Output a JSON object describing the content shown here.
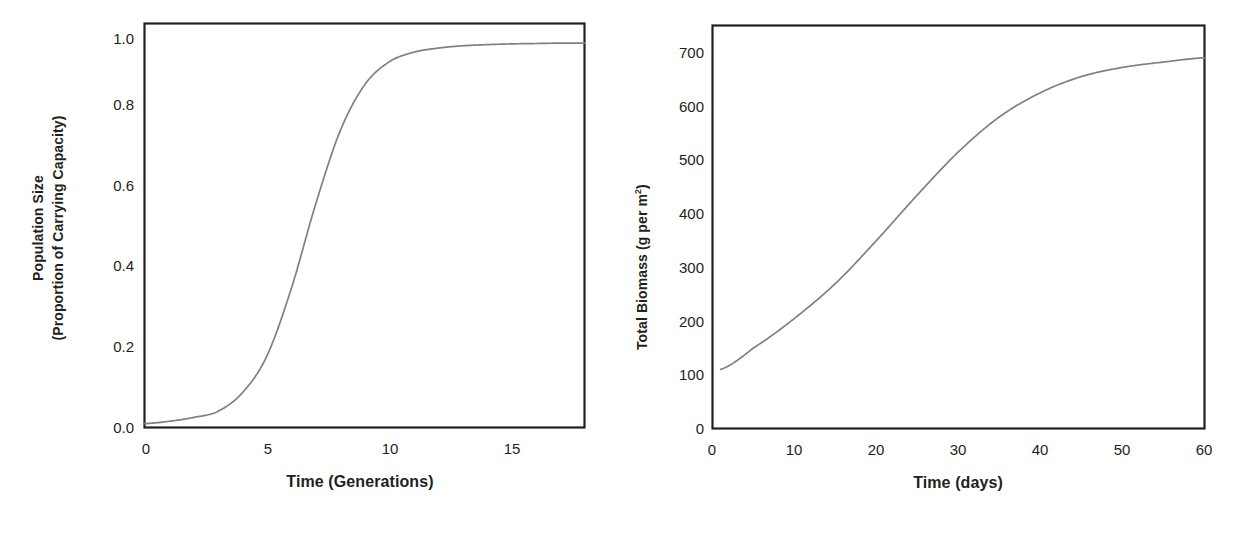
{
  "figure": {
    "background": "#ffffff",
    "line_color": "#808080",
    "frame_color": "#231f20",
    "text_color": "#231f20"
  },
  "chart_data": [
    {
      "id": "logistic-population-growth",
      "type": "line",
      "title": "",
      "xlabel": "Time (Generations)",
      "ylabel_line1": "Population Size",
      "ylabel_line2": "(Proportion of Carrying Capacity)",
      "xlim": [
        0,
        18
      ],
      "ylim": [
        0,
        1.05
      ],
      "xticks": [
        "0",
        "5",
        "10",
        "15"
      ],
      "xtick_values": [
        0,
        5,
        10,
        15
      ],
      "yticks": [
        "0.0",
        "0.2",
        "0.4",
        "0.6",
        "0.8",
        "1.0"
      ],
      "ytick_values": [
        0.0,
        0.2,
        0.4,
        0.6,
        0.8,
        1.0
      ],
      "grid": false,
      "legend": "none",
      "series": [
        {
          "name": "Population size (proportion of K)",
          "color": "#808080",
          "x": [
            0,
            1,
            2,
            3,
            4,
            5,
            6,
            7,
            8,
            9,
            10,
            11,
            12,
            13,
            14,
            15,
            16,
            17,
            18
          ],
          "y": [
            0.01,
            0.016,
            0.026,
            0.042,
            0.09,
            0.185,
            0.36,
            0.58,
            0.77,
            0.89,
            0.95,
            0.975,
            0.986,
            0.992,
            0.995,
            0.997,
            0.998,
            0.999,
            0.999
          ]
        }
      ]
    },
    {
      "id": "total-biomass-accumulation",
      "type": "line",
      "title": "",
      "xlabel": "Time (days)",
      "ylabel": "Total Biomass (g per m2)",
      "ylabel_prefix": "Total Biomass (g per m",
      "ylabel_superscript": "2",
      "ylabel_suffix": ")",
      "xlim": [
        0,
        60
      ],
      "ylim": [
        0,
        750
      ],
      "xticks": [
        "0",
        "10",
        "20",
        "30",
        "40",
        "50",
        "60"
      ],
      "xtick_values": [
        0,
        10,
        20,
        30,
        40,
        50,
        60
      ],
      "yticks": [
        "0",
        "100",
        "200",
        "300",
        "400",
        "500",
        "600",
        "700"
      ],
      "ytick_values": [
        0,
        100,
        200,
        300,
        400,
        500,
        600,
        700
      ],
      "grid": false,
      "legend": "none",
      "series": [
        {
          "name": "Total biomass (g per m2)",
          "color": "#808080",
          "x": [
            1,
            5,
            10,
            15,
            20,
            25,
            30,
            35,
            40,
            45,
            50,
            55,
            60
          ],
          "y": [
            110,
            150,
            205,
            270,
            350,
            435,
            515,
            580,
            625,
            655,
            672,
            682,
            690
          ]
        }
      ]
    }
  ]
}
